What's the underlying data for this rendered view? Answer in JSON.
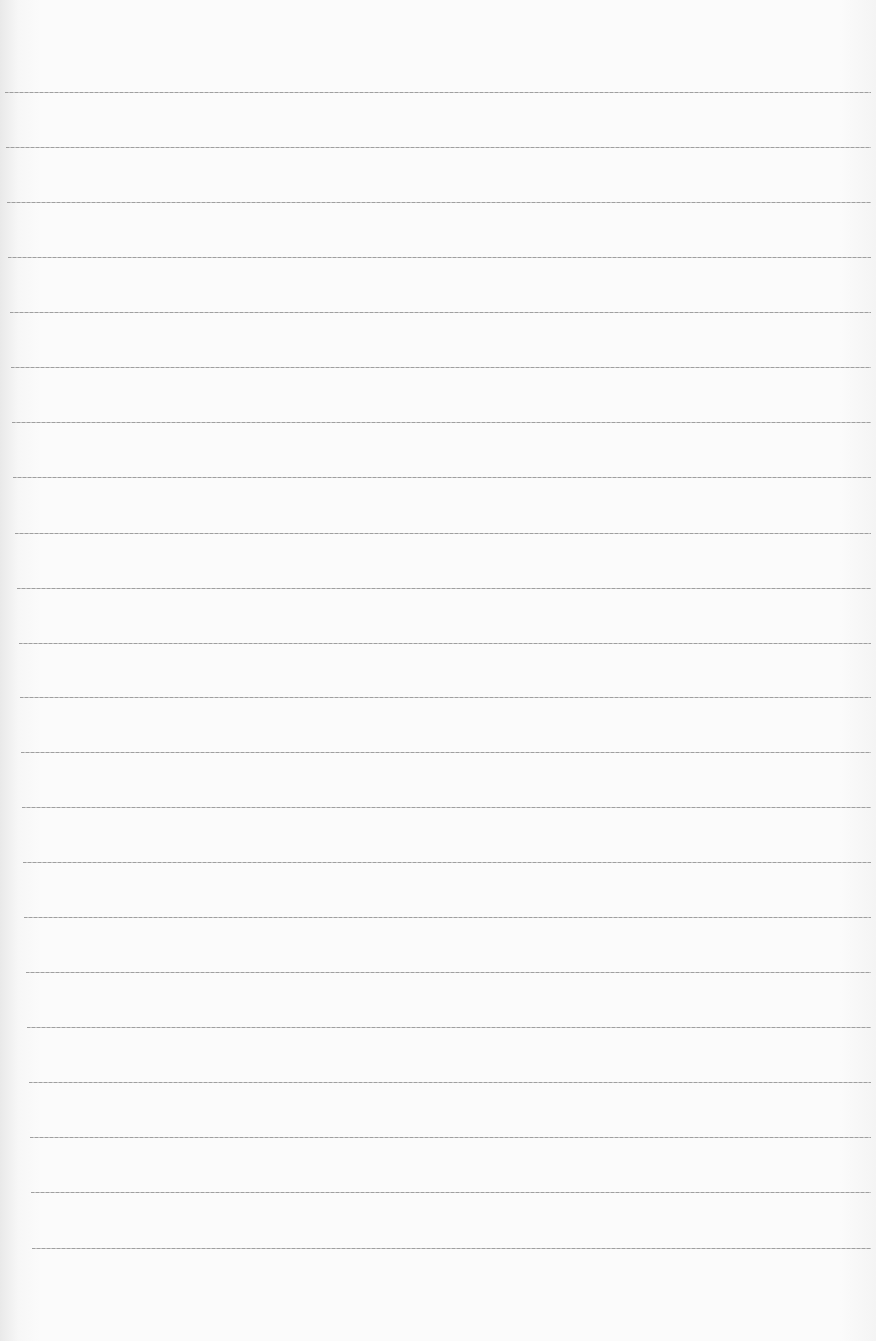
{
  "page": {
    "type": "blank-lined-paper",
    "background_color": "#fbfbfb",
    "rule_color": "#9a9a9a",
    "rules": [
      {
        "y": 92,
        "x_start": 5
      },
      {
        "y": 147,
        "x_start": 6
      },
      {
        "y": 202,
        "x_start": 7
      },
      {
        "y": 257,
        "x_start": 8
      },
      {
        "y": 312,
        "x_start": 10
      },
      {
        "y": 367,
        "x_start": 11
      },
      {
        "y": 422,
        "x_start": 12
      },
      {
        "y": 477,
        "x_start": 13
      },
      {
        "y": 533,
        "x_start": 15
      },
      {
        "y": 588,
        "x_start": 17
      },
      {
        "y": 643,
        "x_start": 19
      },
      {
        "y": 697,
        "x_start": 20
      },
      {
        "y": 752,
        "x_start": 21
      },
      {
        "y": 807,
        "x_start": 22
      },
      {
        "y": 862,
        "x_start": 23
      },
      {
        "y": 917,
        "x_start": 24
      },
      {
        "y": 972,
        "x_start": 26
      },
      {
        "y": 1027,
        "x_start": 27
      },
      {
        "y": 1082,
        "x_start": 29
      },
      {
        "y": 1137,
        "x_start": 30
      },
      {
        "y": 1192,
        "x_start": 31
      },
      {
        "y": 1248,
        "x_start": 32
      }
    ],
    "x_end": 871
  }
}
